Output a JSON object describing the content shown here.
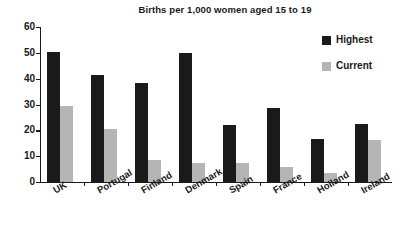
{
  "chart_data": {
    "type": "bar",
    "title": "Births per 1,000 women aged 15 to 19",
    "xlabel": "",
    "ylabel": "",
    "ylim": [
      0,
      60
    ],
    "yticks": [
      0,
      10,
      20,
      30,
      40,
      50,
      60
    ],
    "grid": false,
    "legend_position": "top-right",
    "categories": [
      "UK",
      "Portugal",
      "Finland",
      "Denmark",
      "Spain",
      "France",
      "Holland",
      "Ireland"
    ],
    "series": [
      {
        "name": "Highest",
        "color": "#1a1a1a",
        "values": [
          50.5,
          41.5,
          38.5,
          49.8,
          22.0,
          28.8,
          16.5,
          22.5
        ]
      },
      {
        "name": "Current",
        "color": "#b5b5b5",
        "values": [
          29.5,
          20.5,
          8.5,
          7.5,
          7.5,
          6.0,
          3.5,
          16.3
        ]
      }
    ]
  },
  "axis": {
    "tick_labels": [
      "0",
      "10",
      "20",
      "30",
      "40",
      "50",
      "60"
    ]
  },
  "legend": {
    "items": [
      {
        "label": "Highest",
        "color": "#1a1a1a"
      },
      {
        "label": "Current",
        "color": "#b5b5b5"
      }
    ]
  },
  "colors": {
    "highest": "#1a1a1a",
    "current": "#b5b5b5",
    "axis": "#1a1a1a",
    "background": "#ffffff"
  }
}
